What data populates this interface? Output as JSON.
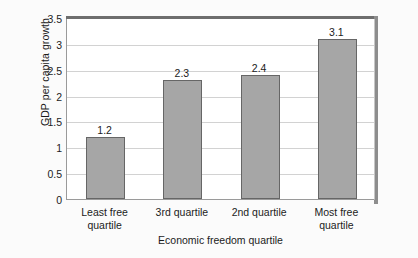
{
  "chart_data": {
    "type": "bar",
    "title": "",
    "categories": [
      "Least free quartile",
      "3rd quartile",
      "2nd quartile",
      "Most free quartile"
    ],
    "category_lines": [
      [
        "Least free",
        "quartile"
      ],
      [
        "3rd quartile",
        ""
      ],
      [
        "2nd quartile",
        ""
      ],
      [
        "Most free",
        "quartile"
      ]
    ],
    "values": [
      1.2,
      2.3,
      2.4,
      3.1
    ],
    "value_labels": [
      "1.2",
      "2.3",
      "2.4",
      "3.1"
    ],
    "xlabel": "Economic freedom quartile",
    "ylabel_line1": "GDP per capita growth",
    "ylabel_line2": "(annual %), 1990–2009",
    "ylim": [
      0,
      3.5
    ],
    "yticks": [
      0,
      0.5,
      1,
      1.5,
      2,
      2.5,
      3,
      3.5
    ],
    "ytick_labels": [
      "0",
      "0.5",
      "1",
      "1.5",
      "2",
      "2.5",
      "3",
      "3.5"
    ],
    "grid": true,
    "grid_axis": "y",
    "legend": null,
    "bar_color": "#a6a6a6",
    "bar_edge_color": "#666666",
    "plot_background": "#ffffff",
    "figure_background": "#fbfbfb",
    "text_color": "#1b1b1b"
  }
}
